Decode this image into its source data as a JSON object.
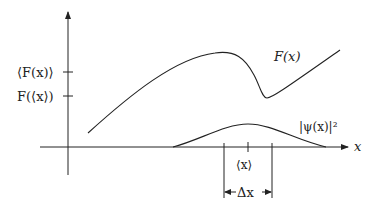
{
  "diagram": {
    "y_axis": {
      "tick_labels": [
        "⟨F(x)⟩",
        "F(⟨x⟩)"
      ]
    },
    "x_axis": {
      "label": "x"
    },
    "curves": [
      {
        "name": "F(x)",
        "label": "F(x)"
      },
      {
        "name": "psi-squared",
        "label": "|ψ(x)|²"
      }
    ],
    "annotations": {
      "mean_label": "⟨x⟩",
      "width_label": "Δx"
    },
    "colors": {
      "stroke": "#222222",
      "background": "#ffffff"
    }
  }
}
